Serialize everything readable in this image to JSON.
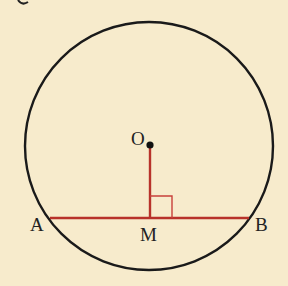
{
  "figure": {
    "type": "geometry",
    "colors": {
      "background": "#f7ebcc",
      "circle": "#1a1a1a",
      "chord": "#b8322a",
      "perpendicular": "#b8322a",
      "right_angle_marker": "#c8403a",
      "center_point": "#111111"
    },
    "circle": {
      "cx": 149,
      "cy": 146,
      "r": 124
    },
    "points": {
      "O": {
        "label": "O",
        "x": 150,
        "y": 145
      },
      "A": {
        "label": "A",
        "x": 50,
        "y": 218
      },
      "B": {
        "label": "B",
        "x": 249,
        "y": 218
      },
      "M": {
        "label": "M",
        "x": 150,
        "y": 218
      }
    },
    "segments": [
      {
        "from": "A",
        "to": "B",
        "name": "chord AB"
      },
      {
        "from": "O",
        "to": "M",
        "name": "perpendicular OM"
      }
    ],
    "right_angle_at": "M"
  }
}
